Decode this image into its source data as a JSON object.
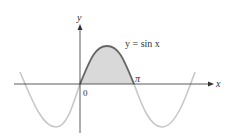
{
  "diagram": {
    "function_label": "y = sin x",
    "x_axis_label": "x",
    "y_axis_label": "y",
    "origin_label": "0",
    "pi_label": "π",
    "shaded_region": "area under y = sin x from 0 to π",
    "colors": {
      "curve_highlight": "#666666",
      "curve_faded": "#c8c8c8",
      "shading": "#d9d9d9",
      "axes": "#333333"
    }
  }
}
